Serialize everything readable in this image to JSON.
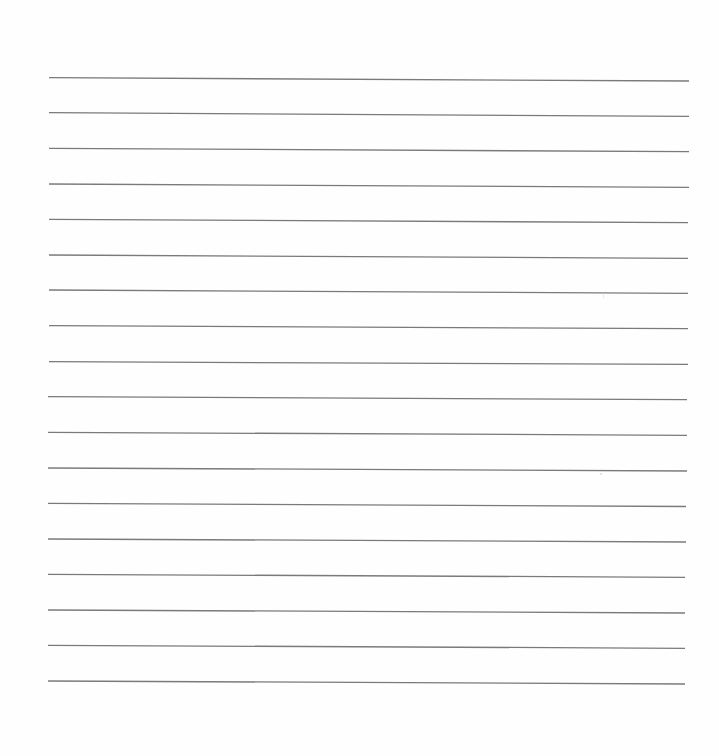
{
  "page": {
    "type": "lined-paper",
    "background_color": "#fefefe",
    "line_color": "#7a7a7a",
    "line_width": 1.3,
    "line_count": 18,
    "lines": [
      {
        "x1": 49,
        "y1": 77.7,
        "x2": 689,
        "y2": 81.0
      },
      {
        "x1": 49,
        "y1": 112.7,
        "x2": 689,
        "y2": 116.3
      },
      {
        "x1": 49,
        "y1": 148.3,
        "x2": 689,
        "y2": 151.7
      },
      {
        "x1": 49,
        "y1": 184.0,
        "x2": 689,
        "y2": 187.3
      },
      {
        "x1": 49,
        "y1": 219.3,
        "x2": 688,
        "y2": 222.7
      },
      {
        "x1": 49,
        "y1": 255.0,
        "x2": 688,
        "y2": 258.3
      },
      {
        "x1": 49,
        "y1": 290.0,
        "x2": 688,
        "y2": 293.3
      },
      {
        "x1": 49,
        "y1": 325.7,
        "x2": 688,
        "y2": 328.7
      },
      {
        "x1": 49,
        "y1": 361.7,
        "x2": 688,
        "y2": 364.3
      },
      {
        "x1": 48,
        "y1": 396.7,
        "x2": 687,
        "y2": 399.7
      },
      {
        "x1": 48,
        "y1": 432.3,
        "x2": 687,
        "y2": 435.3
      },
      {
        "x1": 48,
        "y1": 468.0,
        "x2": 687,
        "y2": 471.0
      },
      {
        "x1": 48,
        "y1": 503.3,
        "x2": 686,
        "y2": 506.5
      },
      {
        "x1": 48,
        "y1": 539.0,
        "x2": 686,
        "y2": 542.0
      },
      {
        "x1": 48,
        "y1": 574.3,
        "x2": 685,
        "y2": 577.3
      },
      {
        "x1": 48,
        "y1": 610.0,
        "x2": 685,
        "y2": 613.0
      },
      {
        "x1": 48,
        "y1": 645.3,
        "x2": 685,
        "y2": 648.3
      },
      {
        "x1": 48,
        "y1": 681.0,
        "x2": 685,
        "y2": 684.0
      }
    ],
    "specks": [
      {
        "x": 603,
        "y": 293,
        "w": 1,
        "h": 5
      },
      {
        "x": 600,
        "y": 473,
        "w": 2,
        "h": 2
      }
    ]
  }
}
